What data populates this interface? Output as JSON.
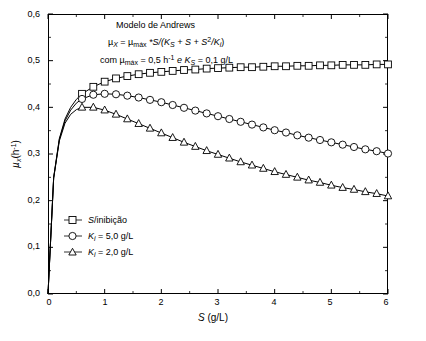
{
  "chart_data": {
    "type": "line",
    "title": "Modelo de Andrews",
    "xlabel": "S (g/L)",
    "ylabel": "µx (h⁻¹)",
    "xlim": [
      0,
      6
    ],
    "ylim": [
      0,
      0.6
    ],
    "xticks": [
      0,
      1,
      2,
      3,
      4,
      5,
      6
    ],
    "yticks": [
      "0,0",
      "0,1",
      "0,2",
      "0,3",
      "0,4",
      "0,5",
      "0,6"
    ],
    "ytick_values": [
      0.0,
      0.1,
      0.2,
      0.3,
      0.4,
      0.5,
      0.6
    ],
    "grid": false,
    "legend_position": "lower-left-inside",
    "annotations": [
      "Modelo de Andrews",
      "µX = µmáx *S/(KS + S + S²/Ki)",
      "com µmáx = 0,5 h⁻¹ e KS = 0,1 g/L"
    ],
    "series": [
      {
        "name": "S/inibição",
        "marker": "square",
        "color": "#000000",
        "x": [
          0,
          0.1,
          0.2,
          0.3,
          0.4,
          0.5,
          0.6,
          0.8,
          1.0,
          1.2,
          1.4,
          1.6,
          1.8,
          2.0,
          2.2,
          2.4,
          2.6,
          2.8,
          3.0,
          3.2,
          3.4,
          3.6,
          3.8,
          4.0,
          4.2,
          4.4,
          4.6,
          4.8,
          5.0,
          5.2,
          5.4,
          5.6,
          5.8,
          6.0
        ],
        "y": [
          0.0,
          0.25,
          0.333,
          0.375,
          0.4,
          0.417,
          0.429,
          0.444,
          0.455,
          0.462,
          0.467,
          0.471,
          0.474,
          0.476,
          0.478,
          0.48,
          0.481,
          0.483,
          0.484,
          0.485,
          0.486,
          0.486,
          0.487,
          0.488,
          0.488,
          0.489,
          0.489,
          0.49,
          0.49,
          0.491,
          0.491,
          0.491,
          0.492,
          0.492
        ]
      },
      {
        "name": "Ki = 5,0 g/L",
        "marker": "circle",
        "color": "#000000",
        "x": [
          0,
          0.1,
          0.2,
          0.3,
          0.4,
          0.5,
          0.6,
          0.8,
          1.0,
          1.2,
          1.4,
          1.6,
          1.8,
          2.0,
          2.2,
          2.4,
          2.6,
          2.8,
          3.0,
          3.2,
          3.4,
          3.6,
          3.8,
          4.0,
          4.2,
          4.4,
          4.6,
          4.8,
          5.0,
          5.2,
          5.4,
          5.6,
          5.8,
          6.0
        ],
        "y": [
          0.0,
          0.249,
          0.331,
          0.371,
          0.394,
          0.409,
          0.418,
          0.427,
          0.429,
          0.428,
          0.425,
          0.421,
          0.416,
          0.411,
          0.405,
          0.399,
          0.393,
          0.387,
          0.381,
          0.375,
          0.369,
          0.363,
          0.357,
          0.351,
          0.346,
          0.34,
          0.335,
          0.33,
          0.325,
          0.32,
          0.315,
          0.31,
          0.306,
          0.301
        ]
      },
      {
        "name": "Ki = 2,0 g/L",
        "marker": "triangle",
        "color": "#000000",
        "x": [
          0,
          0.1,
          0.2,
          0.3,
          0.4,
          0.5,
          0.6,
          0.8,
          1.0,
          1.2,
          1.4,
          1.6,
          1.8,
          2.0,
          2.2,
          2.4,
          2.6,
          2.8,
          3.0,
          3.2,
          3.4,
          3.6,
          3.8,
          4.0,
          4.2,
          4.4,
          4.6,
          4.8,
          5.0,
          5.2,
          5.4,
          5.6,
          5.8,
          6.0
        ],
        "y": [
          0.0,
          0.248,
          0.328,
          0.366,
          0.385,
          0.395,
          0.4,
          0.4,
          0.394,
          0.385,
          0.375,
          0.365,
          0.355,
          0.345,
          0.335,
          0.325,
          0.316,
          0.307,
          0.299,
          0.291,
          0.283,
          0.276,
          0.269,
          0.262,
          0.256,
          0.25,
          0.244,
          0.239,
          0.233,
          0.228,
          0.224,
          0.219,
          0.215,
          0.21
        ]
      }
    ]
  },
  "legend": {
    "items": [
      {
        "label": "S/inibição",
        "marker": "square"
      },
      {
        "label": "K",
        "sub": "i",
        "rest": " = 5,0 g/L",
        "marker": "circle"
      },
      {
        "label": "K",
        "sub": "i",
        "rest": " = 2,0 g/L",
        "marker": "triangle"
      }
    ]
  },
  "axes": {
    "x_title_main": "S",
    "x_title_unit": " (g/L)",
    "y_title_main": "µ",
    "y_title_sub": "x",
    "y_title_unit": "(h",
    "y_title_sup": "-1",
    "y_title_close": ")"
  },
  "annotations": {
    "title": "Modelo de Andrews",
    "eq_mu": "µ",
    "eq_sub_x": "X",
    "eq_eq": " = µ",
    "eq_sub_max": "máx",
    "eq_body1": " *S/(K",
    "eq_sub_s1": "S",
    "eq_body2": " + S + S",
    "eq_sup2": "2",
    "eq_body3": "/K",
    "eq_sub_i": "i",
    "eq_body4": ")",
    "p_com": "com µ",
    "p_sub_max": "máx",
    "p_mid": " = 0,5 h",
    "p_sup": "-1",
    "p_e": " e K",
    "p_sub_s": "S",
    "p_end": " = 0,1 g/L"
  }
}
